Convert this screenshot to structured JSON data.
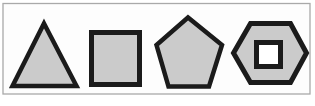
{
  "figure": {
    "canvas": {
      "width": 315,
      "height": 106,
      "background": "#ffffff"
    },
    "frame": {
      "name": "image-frame",
      "x": 3,
      "y": 3.5,
      "width": 307,
      "height": 90.5,
      "fill": "#fdfdfd",
      "stroke": "#a9a9a9",
      "stroke_width": 1.3
    },
    "style": {
      "shape_fill": "#cbcbcb",
      "shape_stroke": "#1b1b1b",
      "hole_fill": "#ffffff"
    },
    "shapes": [
      {
        "name": "triangle-shape",
        "type": "polygon",
        "points": [
          [
            44,
            23.5
          ],
          [
            76.5,
            86
          ],
          [
            12.5,
            86
          ]
        ],
        "fill": "#cbcbcb",
        "stroke": "#1b1b1b",
        "stroke_width": 4.5
      },
      {
        "name": "square-shape",
        "type": "polygon",
        "points": [
          [
            91.5,
            32.5
          ],
          [
            139.5,
            32.5
          ],
          [
            139.5,
            84.5
          ],
          [
            91.5,
            84.5
          ]
        ],
        "fill": "#cbcbcb",
        "stroke": "#1b1b1b",
        "stroke_width": 5
      },
      {
        "name": "pentagon-shape",
        "type": "polygon",
        "points": [
          [
            188,
            17.5
          ],
          [
            156.5,
            45
          ],
          [
            168.5,
            86.5
          ],
          [
            209,
            86.5
          ],
          [
            222,
            45
          ]
        ],
        "fill": "#cbcbcb",
        "stroke": "#1b1b1b",
        "stroke_width": 4.5
      },
      {
        "name": "hexagon-shape",
        "type": "polygon",
        "points": [
          [
            233.5,
            53
          ],
          [
            250.5,
            23.5
          ],
          [
            290.5,
            23.5
          ],
          [
            306.5,
            53
          ],
          [
            290.5,
            82.5
          ],
          [
            250.5,
            82.5
          ]
        ],
        "fill": "#cbcbcb",
        "stroke": "#1b1b1b",
        "stroke_width": 5
      },
      {
        "name": "hexagon-inner-square-hole",
        "type": "polygon",
        "points": [
          [
            256.5,
            42.5
          ],
          [
            280.5,
            42.5
          ],
          [
            280.5,
            66.5
          ],
          [
            256.5,
            66.5
          ]
        ],
        "fill": "#ffffff",
        "stroke": "#1b1b1b",
        "stroke_width": 5
      }
    ]
  }
}
